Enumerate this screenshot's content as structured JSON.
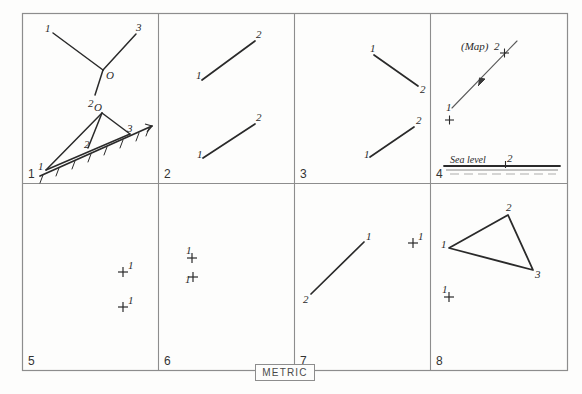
{
  "sheet": {
    "footer_label": "METRIC",
    "border_color": "#8d8d8d",
    "ink_color": "#2a2a2a",
    "background": "#fdfdfc"
  },
  "panels": [
    {
      "number": "1",
      "figures": [
        {
          "kind": "three-ray-vertex",
          "vertex_label": "O",
          "ray_labels": [
            "1",
            "3",
            "2"
          ]
        },
        {
          "kind": "hatched-ground-with-station",
          "vertex_label": "O",
          "ground_labels": [
            "1",
            "2",
            "3"
          ]
        }
      ]
    },
    {
      "number": "2",
      "figures": [
        {
          "kind": "segment",
          "labels": [
            "1",
            "2"
          ],
          "direction": "up-right"
        },
        {
          "kind": "segment",
          "labels": [
            "1",
            "2"
          ],
          "direction": "up-right"
        }
      ]
    },
    {
      "number": "3",
      "figures": [
        {
          "kind": "segment",
          "labels": [
            "1",
            "2"
          ],
          "direction": "down-right"
        },
        {
          "kind": "segment",
          "labels": [
            "1",
            "2"
          ],
          "direction": "up-right"
        }
      ]
    },
    {
      "number": "4",
      "figures": [
        {
          "kind": "map-line",
          "caption": "(Map)",
          "labels": [
            "1",
            "2"
          ]
        },
        {
          "kind": "sea-level",
          "caption": "Sea level",
          "labels": [
            "2"
          ]
        }
      ]
    },
    {
      "number": "5",
      "figures": [
        {
          "kind": "cross-point",
          "labels": [
            "1"
          ]
        },
        {
          "kind": "cross-point",
          "labels": [
            "1"
          ]
        }
      ]
    },
    {
      "number": "6",
      "figures": [
        {
          "kind": "cross-point",
          "labels": [
            "1"
          ]
        },
        {
          "kind": "cross-point",
          "labels": [
            "1"
          ]
        }
      ]
    },
    {
      "number": "7",
      "figures": [
        {
          "kind": "segment",
          "labels": [
            "2",
            "1"
          ],
          "direction": "up-right"
        },
        {
          "kind": "cross-point",
          "labels": [
            "1"
          ]
        }
      ]
    },
    {
      "number": "8",
      "figures": [
        {
          "kind": "triangle",
          "labels": [
            "1",
            "2",
            "3"
          ]
        },
        {
          "kind": "cross-point",
          "labels": [
            "1"
          ]
        }
      ]
    }
  ],
  "text": {
    "p1_upper_l1": "1",
    "p1_upper_l3": "3",
    "p1_upper_l2": "2",
    "p1_upper_o": "O",
    "p1_lower_o": "O",
    "p1_lower_l1": "1",
    "p1_lower_l2": "2",
    "p1_lower_l3": "3",
    "p2_a1": "1",
    "p2_a2": "2",
    "p2_b1": "1",
    "p2_b2": "2",
    "p3_a1": "1",
    "p3_a2": "2",
    "p3_b1": "1",
    "p3_b2": "2",
    "p4_map": "(Map)",
    "p4_l1": "1",
    "p4_l2": "2",
    "p4_sea": "Sea level",
    "p4_sea_2": "2",
    "p5_a1": "1",
    "p5_b1": "1",
    "p6_a1": "1",
    "p6_b1": "1",
    "p7_l2": "2",
    "p7_l1": "1",
    "p7_c1": "1",
    "p8_l1": "1",
    "p8_l2": "2",
    "p8_l3": "3",
    "p8_c1": "1",
    "num1": "1",
    "num2": "2",
    "num3": "3",
    "num4": "4",
    "num5": "5",
    "num6": "6",
    "num7": "7",
    "num8": "8"
  }
}
